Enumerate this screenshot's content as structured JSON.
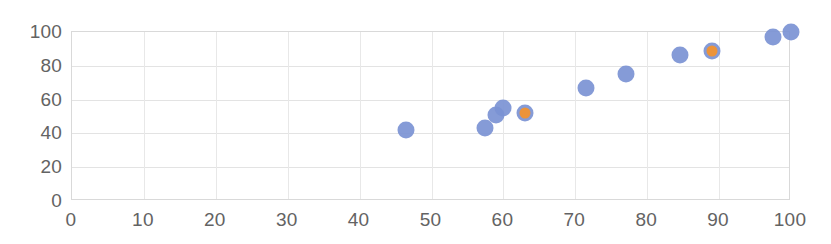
{
  "chart_data": {
    "type": "scatter",
    "title": "",
    "subtitle": "",
    "xlabel": "",
    "ylabel": "",
    "xlim": [
      0,
      100
    ],
    "ylim": [
      0,
      100
    ],
    "x_ticks": [
      0,
      10,
      20,
      30,
      40,
      50,
      60,
      70,
      80,
      90,
      100
    ],
    "y_ticks": [
      0,
      20,
      40,
      60,
      80,
      100
    ],
    "x_tick_labels": [
      "0",
      "10",
      "20",
      "30",
      "40",
      "50",
      "60",
      "70",
      "80",
      "90",
      "100"
    ],
    "y_tick_labels": [
      "0",
      "20",
      "40",
      "60",
      "80",
      "100"
    ],
    "grid": true,
    "grid_axes": "both",
    "legend": false,
    "legend_position": "none",
    "annotations": [],
    "colors": {
      "series_1": "#7b93d4",
      "series_2": "#f09335",
      "grid": "#e3e3e3",
      "axis_text": "#636363",
      "plot_border": "#d9d9d9",
      "background": "#ffffff"
    },
    "series": [
      {
        "name": "Series 1",
        "color": "#7b93d4",
        "marker": "circle",
        "marker_size": 17,
        "points": [
          {
            "x": 46.5,
            "y": 42
          },
          {
            "x": 57.5,
            "y": 43
          },
          {
            "x": 59.0,
            "y": 51
          },
          {
            "x": 60.0,
            "y": 55
          },
          {
            "x": 63.0,
            "y": 52
          },
          {
            "x": 71.5,
            "y": 67
          },
          {
            "x": 77.0,
            "y": 75
          },
          {
            "x": 84.5,
            "y": 86.5
          },
          {
            "x": 89.0,
            "y": 89
          },
          {
            "x": 97.5,
            "y": 97
          },
          {
            "x": 100.0,
            "y": 100
          }
        ]
      },
      {
        "name": "Series 2",
        "color": "#f09335",
        "marker": "circle",
        "marker_size": 11,
        "points": [
          {
            "x": 63.0,
            "y": 52
          },
          {
            "x": 89.0,
            "y": 89
          }
        ]
      }
    ]
  }
}
